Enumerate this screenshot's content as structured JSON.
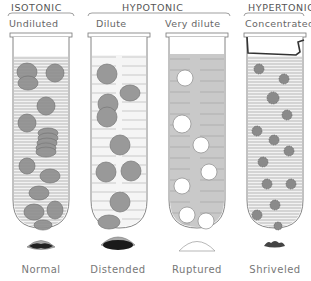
{
  "diagram": {
    "groups": [
      {
        "label": "ISOTONIC"
      },
      {
        "label": "HYPOTONIC"
      },
      {
        "label": "HYPERTONIC"
      }
    ],
    "tubes": [
      {
        "solution": "Undiluted",
        "cell_state": "Normal"
      },
      {
        "solution": "Dilute",
        "cell_state": "Distended"
      },
      {
        "solution": "Very dilute",
        "cell_state": "Ruptured"
      },
      {
        "solution": "Concentrated",
        "cell_state": "Shriveled"
      }
    ]
  }
}
